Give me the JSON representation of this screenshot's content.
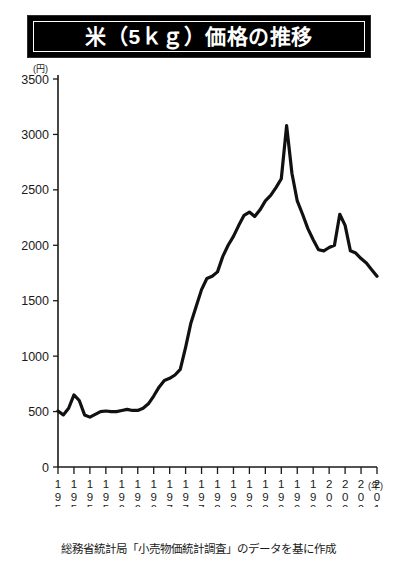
{
  "header": {
    "title": "米（5ｋｇ）価格の推移"
  },
  "footer": {
    "source_note": "総務省統計局「小売物価統計調査」のデータを基に作成"
  },
  "axis": {
    "y_unit": "(円)",
    "x_unit": "(年)"
  },
  "chart_data": {
    "type": "line",
    "title": "米（5ｋｇ）価格の推移",
    "subtitle": "",
    "xlabel": "(年)",
    "ylabel": "(円)",
    "ylim": [
      0,
      3500
    ],
    "xlim": [
      1950,
      2010
    ],
    "ytick_labels": [
      "0",
      "500",
      "1000",
      "1500",
      "2000",
      "2500",
      "3000",
      "3500"
    ],
    "ytick_values": [
      0,
      500,
      1000,
      1500,
      2000,
      2500,
      3000,
      3500
    ],
    "xtick_labels": [
      "1950",
      "1953",
      "1956",
      "1959",
      "1962",
      "1965",
      "1968",
      "1971",
      "1974",
      "1977",
      "1980",
      "1983",
      "1986",
      "1989",
      "1992",
      "1995",
      "1998",
      "2001",
      "2004",
      "2007",
      "2010"
    ],
    "xtick_values": [
      1950,
      1953,
      1956,
      1959,
      1962,
      1965,
      1968,
      1971,
      1974,
      1977,
      1980,
      1983,
      1986,
      1989,
      1992,
      1995,
      1998,
      2001,
      2004,
      2007,
      2010
    ],
    "grid": false,
    "legend": [],
    "legend_position": "none",
    "line_color": "#111111",
    "series": [
      {
        "name": "米（5kg）価格",
        "x": [
          1950,
          1951,
          1952,
          1953,
          1954,
          1955,
          1956,
          1957,
          1958,
          1959,
          1960,
          1961,
          1962,
          1963,
          1964,
          1965,
          1966,
          1967,
          1968,
          1969,
          1970,
          1971,
          1972,
          1973,
          1974,
          1975,
          1976,
          1977,
          1978,
          1979,
          1980,
          1981,
          1982,
          1983,
          1984,
          1985,
          1986,
          1987,
          1988,
          1989,
          1990,
          1991,
          1992,
          1993,
          1994,
          1995,
          1996,
          1997,
          1998,
          1999,
          2000,
          2001,
          2002,
          2003,
          2004,
          2005,
          2006,
          2007,
          2008,
          2009,
          2010
        ],
        "values": [
          505,
          470,
          530,
          650,
          600,
          470,
          450,
          475,
          500,
          505,
          500,
          500,
          510,
          520,
          510,
          510,
          530,
          570,
          640,
          720,
          780,
          800,
          830,
          880,
          1080,
          1300,
          1450,
          1600,
          1700,
          1720,
          1760,
          1900,
          2000,
          2080,
          2180,
          2270,
          2300,
          2260,
          2320,
          2400,
          2450,
          2520,
          2600,
          3080,
          2650,
          2400,
          2280,
          2150,
          2050,
          1960,
          1950,
          1980,
          2000,
          2280,
          2180,
          1950,
          1930,
          1880,
          1840,
          1780,
          1720
        ]
      }
    ],
    "annotations": []
  }
}
